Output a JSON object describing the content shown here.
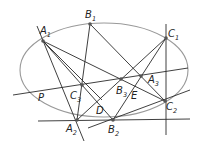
{
  "diagram": {
    "type": "pascal-hexagon-ellipse",
    "colors": {
      "ellipse": "#999999",
      "lines": "#2a2a2a",
      "points": "#555555",
      "background": "#ffffff"
    },
    "points": [
      {
        "id": "A1",
        "base": "A",
        "sub": "1",
        "x": 43,
        "y": 41,
        "lx": 40,
        "ly": 34
      },
      {
        "id": "B1",
        "base": "B",
        "sub": "1",
        "x": 90,
        "y": 24,
        "lx": 85,
        "ly": 18
      },
      {
        "id": "C1",
        "base": "C",
        "sub": "1",
        "x": 166,
        "y": 38,
        "lx": 168,
        "ly": 37
      },
      {
        "id": "A2",
        "base": "A",
        "sub": "2",
        "x": 77,
        "y": 120,
        "lx": 66,
        "ly": 132
      },
      {
        "id": "B2",
        "base": "B",
        "sub": "2",
        "x": 113,
        "y": 120,
        "lx": 108,
        "ly": 133
      },
      {
        "id": "C2",
        "base": "C",
        "sub": "2",
        "x": 165,
        "y": 101,
        "lx": 166,
        "ly": 110
      },
      {
        "id": "C3",
        "base": "C",
        "sub": "3",
        "x": 82,
        "y": 85,
        "lx": 70,
        "ly": 99
      },
      {
        "id": "B3",
        "base": "B",
        "sub": "3",
        "x": 121,
        "y": 79,
        "lx": 116,
        "ly": 94
      },
      {
        "id": "A3",
        "base": "A",
        "sub": "3",
        "x": 141,
        "y": 76,
        "lx": 148,
        "ly": 83
      },
      {
        "id": "D",
        "base": "D",
        "sub": "",
        "x": 102,
        "y": 100,
        "lx": 96,
        "ly": 114
      },
      {
        "id": "E",
        "base": "E",
        "sub": "",
        "x": 133,
        "y": 90,
        "lx": 131,
        "ly": 99
      },
      {
        "id": "P",
        "base": "P",
        "sub": "",
        "x": 40,
        "y": 97,
        "lx": 38,
        "ly": 101
      }
    ],
    "ellipse": {
      "cx": 104,
      "cy": 70,
      "rx": 84,
      "ry": 47
    },
    "lines": [
      {
        "x1": 37,
        "y1": 26,
        "x2": 84,
        "y2": 141
      },
      {
        "x1": 43,
        "y1": 41,
        "x2": 113,
        "y2": 120
      },
      {
        "x1": 43,
        "y1": 41,
        "x2": 165,
        "y2": 101
      },
      {
        "x1": 43,
        "y1": 41,
        "x2": 102,
        "y2": 100
      },
      {
        "x1": 90,
        "y1": 24,
        "x2": 77,
        "y2": 120
      },
      {
        "x1": 90,
        "y1": 24,
        "x2": 165,
        "y2": 101
      },
      {
        "x1": 166,
        "y1": 24,
        "x2": 166,
        "y2": 135
      },
      {
        "x1": 166,
        "y1": 38,
        "x2": 77,
        "y2": 120
      },
      {
        "x1": 166,
        "y1": 38,
        "x2": 113,
        "y2": 120
      },
      {
        "x1": 13,
        "y1": 95,
        "x2": 188,
        "y2": 68
      },
      {
        "x1": 38,
        "y1": 121,
        "x2": 190,
        "y2": 119
      },
      {
        "x1": 88,
        "y1": 128,
        "x2": 190,
        "y2": 90
      }
    ]
  }
}
